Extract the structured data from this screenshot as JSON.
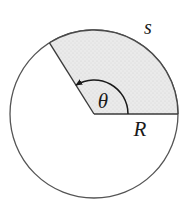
{
  "figure": {
    "type": "geometry-diagram",
    "background_color": "#ffffff",
    "canvas": {
      "width": 189,
      "height": 218
    }
  },
  "circle": {
    "name": "main-circle",
    "center_x": 94,
    "center_y": 114,
    "radius": 84,
    "stroke_color": "#555555",
    "stroke_width": 1.3,
    "fill_color": "#ffffff"
  },
  "sector": {
    "name": "shaded-sector",
    "start_angle_deg": 0,
    "end_angle_deg": 122,
    "fill_color": "#e8e8e8",
    "stroke_color": "#4a4a4a",
    "stroke_width": 1.3,
    "texture": "stipple"
  },
  "radii": [
    {
      "name": "horizontal-radius",
      "angle_deg": 0,
      "label": "R",
      "end_x": 178,
      "end_y": 114
    },
    {
      "name": "upper-left-radius",
      "angle_deg": 122,
      "end_x": 49,
      "end_y": 43
    }
  ],
  "angle_arc": {
    "name": "theta-arc",
    "radius": 34,
    "start_angle_deg": 0,
    "end_angle_deg": 122,
    "arrow_at": "end",
    "stroke_color": "#1a1a1a",
    "stroke_width": 1.4
  },
  "labels": {
    "arc_length": {
      "text": "s",
      "x": 148,
      "y": 34,
      "meaning": "arc length"
    },
    "radius": {
      "text": "R",
      "x": 140,
      "y": 136,
      "meaning": "radius"
    },
    "angle": {
      "text": "θ",
      "x": 103,
      "y": 108,
      "meaning": "central angle theta"
    }
  },
  "colors": {
    "ink": "#1a1a1a",
    "outline": "#555555",
    "shade": "#e8e8e8",
    "paper": "#ffffff"
  }
}
